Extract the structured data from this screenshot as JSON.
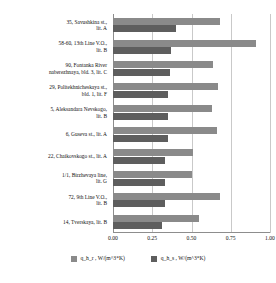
{
  "chart_data": {
    "type": "bar",
    "orientation": "horizontal",
    "title": "",
    "xlabel": "",
    "ylabel": "",
    "xlim": [
      0.0,
      1.0
    ],
    "xticks": [
      "0.00",
      "0.25",
      "0.50",
      "0.75",
      "1.00"
    ],
    "xtick_values": [
      0.0,
      0.25,
      0.5,
      0.75,
      1.0
    ],
    "grid": true,
    "legend_position": "bottom",
    "categories": [
      "35, Savushkina st., lit. A",
      "58-60, 13th Line V.O., lit. B",
      "90, Fontanka River naberezhnaya, bld. 3, lit. C",
      "29, Politekhnicheskaya st., bld. 1, lit. F",
      "5, Aleksandara Nevskogo, lit. B",
      "6, Guseva st., lit. A",
      "22, Chaikovskogo st., lit. A",
      "1/1, Birzhevaya line, lit. G",
      "72, 9th Line V.O., lit. B",
      "14, Tverskaya, lit. B"
    ],
    "category_lines": [
      [
        "35, Savushkina st.,",
        "lit. A"
      ],
      [
        "58-60, 13th Line V.O.,",
        "lit. B"
      ],
      [
        "90, Fontanka River",
        "naberezhnaya, bld. 3, lit. C"
      ],
      [
        "29, Politekhnicheskaya st.,",
        "bld. 1, lit. F"
      ],
      [
        "5, Aleksandara Nevskogo,",
        "lit. B"
      ],
      [
        "6, Guseva st., lit. A"
      ],
      [
        "22, Chaikovskogo st., lit. A"
      ],
      [
        "1/1, Birzhevaya line,",
        "lit. G"
      ],
      [
        "72, 9th Line V.O.,",
        "lit. B"
      ],
      [
        "14, Tverskaya, lit. B"
      ]
    ],
    "series": [
      {
        "name": "q_h_r , W/(m^3*K)",
        "color": "#8a8a8a",
        "values": [
          0.68,
          0.91,
          0.64,
          0.67,
          0.63,
          0.66,
          0.51,
          0.5,
          0.68,
          0.55
        ]
      },
      {
        "name": "q_h_s , W/(m^3*K)",
        "color": "#5e5e5e",
        "values": [
          0.4,
          0.37,
          0.36,
          0.35,
          0.35,
          0.35,
          0.33,
          0.33,
          0.33,
          0.31
        ]
      }
    ]
  },
  "legend": {
    "items": [
      {
        "label": "q_h_r , W/(m^3*K)"
      },
      {
        "label": "q_h_s , W/(m^3*K)"
      }
    ]
  }
}
